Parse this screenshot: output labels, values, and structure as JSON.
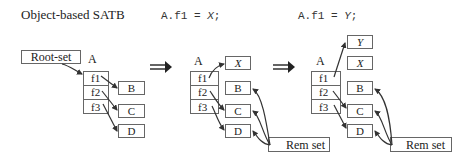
{
  "header": {
    "title": "Object-based SATB",
    "step1_code": "A.f1 = ",
    "step1_var": "X",
    "step1_end": ";",
    "step2_code": "A.f1 = ",
    "step2_var": "Y",
    "step2_end": ";"
  },
  "panel1": {
    "root_set_label": "Root-set",
    "object_label": "A",
    "fields": [
      "f1",
      "f2",
      "f3"
    ],
    "targets": [
      "B",
      "C",
      "D"
    ]
  },
  "panel2": {
    "object_label": "A",
    "fields": [
      "f1",
      "f2",
      "f3"
    ],
    "new_target": "X",
    "targets": [
      "B",
      "C",
      "D"
    ],
    "rem_set_label": "Rem set"
  },
  "panel3": {
    "object_label": "A",
    "fields": [
      "f1",
      "f2",
      "f3"
    ],
    "new_target": "Y",
    "old_target": "X",
    "targets": [
      "B",
      "C",
      "D"
    ],
    "rem_set_label": "Rem set"
  },
  "transitions": [
    "double-arrow-right",
    "double-arrow-right"
  ],
  "colors": {
    "stroke": "#666666",
    "arrow": "#333333",
    "text": "#222222"
  }
}
